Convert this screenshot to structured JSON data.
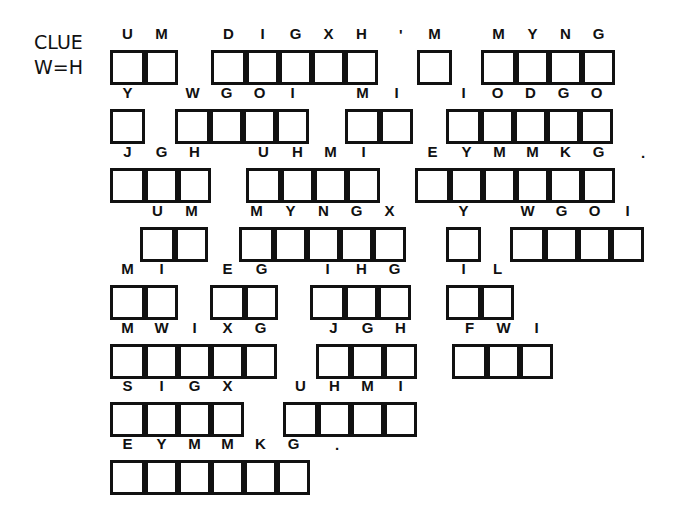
{
  "clue": {
    "line1": "CLUE",
    "line2": "W=H"
  },
  "rows": [
    {
      "top": 50,
      "words": [
        {
          "left": 110,
          "letters": [
            "U",
            "M"
          ]
        },
        {
          "left": 211,
          "letters": [
            "D",
            "I",
            "G",
            "X",
            "H"
          ]
        },
        {
          "left": 417,
          "letters": [
            "M"
          ]
        },
        {
          "left": 481,
          "letters": [
            "M",
            "Y",
            "N",
            "G"
          ]
        }
      ],
      "punct": [
        {
          "left": 399,
          "text": "'"
        }
      ]
    },
    {
      "top": 109,
      "words": [
        {
          "left": 110,
          "letters": [
            "Y"
          ]
        },
        {
          "left": 175,
          "letters": [
            "W",
            "G",
            "O",
            "I"
          ]
        },
        {
          "left": 345,
          "letters": [
            "M",
            "I"
          ]
        },
        {
          "left": 446,
          "letters": [
            "I",
            "O",
            "D",
            "G",
            "O"
          ]
        }
      ],
      "punct": []
    },
    {
      "top": 168,
      "words": [
        {
          "left": 110,
          "letters": [
            "J",
            "G",
            "H"
          ]
        },
        {
          "left": 246,
          "letters": [
            "U",
            "H",
            "M",
            "I"
          ]
        },
        {
          "left": 415,
          "letters": [
            "E",
            "Y",
            "M",
            "M",
            "K",
            "G"
          ]
        }
      ],
      "punct": [
        {
          "left": 641,
          "text": "."
        }
      ]
    },
    {
      "top": 227,
      "words": [
        {
          "left": 140,
          "letters": [
            "U",
            "M"
          ]
        },
        {
          "left": 239,
          "letters": [
            "M",
            "Y",
            "N",
            "G",
            "X"
          ]
        },
        {
          "left": 446,
          "letters": [
            "Y"
          ]
        },
        {
          "left": 510,
          "letters": [
            "W",
            "G",
            "O",
            "I"
          ]
        }
      ],
      "punct": []
    },
    {
      "top": 285,
      "words": [
        {
          "left": 110,
          "letters": [
            "M",
            "I"
          ]
        },
        {
          "left": 210,
          "letters": [
            "E",
            "G"
          ]
        },
        {
          "left": 310,
          "letters": [
            "I",
            "H",
            "G"
          ]
        },
        {
          "left": 446,
          "letters": [
            "I",
            "L"
          ]
        }
      ],
      "punct": []
    },
    {
      "top": 344,
      "words": [
        {
          "left": 110,
          "letters": [
            "M",
            "W",
            "I",
            "X",
            "G"
          ]
        },
        {
          "left": 316,
          "letters": [
            "J",
            "G",
            "H"
          ]
        },
        {
          "left": 452,
          "letters": [
            "F",
            "W",
            "I"
          ]
        }
      ],
      "punct": []
    },
    {
      "top": 402,
      "words": [
        {
          "left": 110,
          "letters": [
            "S",
            "I",
            "G",
            "X"
          ]
        },
        {
          "left": 283,
          "letters": [
            "U",
            "H",
            "M",
            "I"
          ]
        }
      ],
      "punct": []
    },
    {
      "top": 460,
      "words": [
        {
          "left": 110,
          "letters": [
            "E",
            "Y",
            "M",
            "M",
            "K",
            "G"
          ]
        }
      ],
      "punct": [
        {
          "left": 335,
          "text": "."
        }
      ]
    }
  ]
}
